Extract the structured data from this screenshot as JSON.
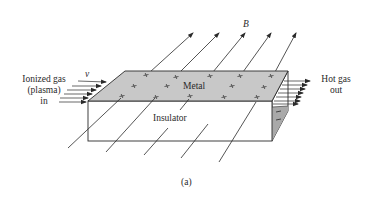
{
  "diagram": {
    "caption": "(a)",
    "labels": {
      "inlet_line1": "Ionized gas",
      "inlet_line2": "(plasma)",
      "inlet_line3": "in",
      "velocity": "v",
      "field": "B",
      "top_plate": "Metal",
      "body": "Insulator",
      "outlet_line1": "Hot gas",
      "outlet_line2": "out"
    },
    "colors": {
      "metal_fill": "#c8c8c8",
      "side_shade": "#a9a9a9",
      "line": "#2a2a2a",
      "background": "#ffffff"
    },
    "charges": {
      "top_surface": "+",
      "side_surface": "-"
    }
  }
}
